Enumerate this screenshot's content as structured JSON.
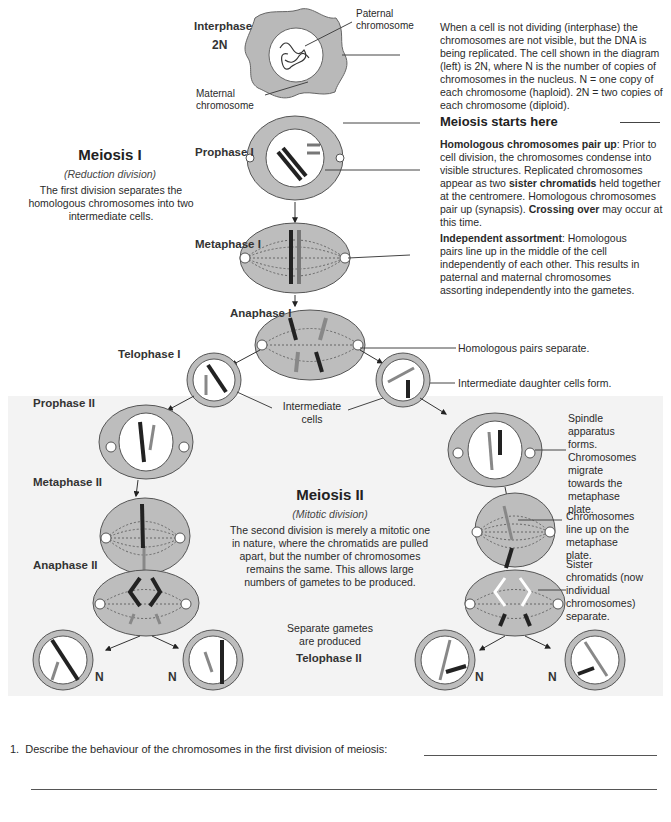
{
  "interphase": {
    "stage": "Interphase",
    "ploidy": "2N",
    "label_paternal": "Paternal\nchromosome",
    "label_maternal": "Maternal\nchromosome",
    "description": "When a cell is not dividing (interphase) the chromosomes are not visible, but the DNA is being replicated. The cell shown in the diagram (left) is 2N, where N is the number of copies of chromosomes in the nucleus. N = one copy of each chromosome (haploid). 2N = two copies of each chromosome (diploid)."
  },
  "meiosis_start": "Meiosis starts here",
  "meiosis1": {
    "title": "Meiosis I",
    "subtitle": "(Reduction division)",
    "description": "The first division separates the homologous chromosomes into two intermediate cells."
  },
  "stages": {
    "prophase1": "Prophase I",
    "metaphase1": "Metaphase I",
    "anaphase1": "Anaphase I",
    "telophase1": "Telophase I",
    "prophase2": "Prophase II",
    "metaphase2": "Metaphase II",
    "anaphase2": "Anaphase II",
    "telophase2": "Telophase II"
  },
  "notes": {
    "prophase1_bold": "Homologous chromosomes pair up",
    "prophase1_a": ": Prior to cell division, the chromosomes condense into visible structures. Replicated chromosomes appear as two ",
    "prophase1_bold2": "sister chromatids",
    "prophase1_b": " held together at the centromere. Homologous chromosomes pair up (synapsis). ",
    "prophase1_bold3": "Crossing over",
    "prophase1_c": " may occur at this time.",
    "metaphase1_bold": "Independent assortment",
    "metaphase1_text": ": Homologous pairs line up in the middle of the cell independently of each other. This results in paternal and maternal chromosomes assorting independently into the gametes.",
    "anaphase1": "Homologous pairs separate.",
    "telophase1": "Intermediate daughter cells form.",
    "intermediate_cells": "Intermediate\ncells",
    "prophase2": "Spindle apparatus forms. Chromosomes migrate towards the metaphase plate.",
    "metaphase2": "Chromosomes line up on the metaphase plate.",
    "anaphase2": "Sister chromatids (now individual chromosomes) separate.",
    "gametes": "Separate gametes are produced"
  },
  "meiosis2": {
    "title": "Meiosis II",
    "subtitle": "(Mitotic division)",
    "description": "The second division is merely a mitotic one in nature, where the chromatids are pulled apart, but the number of chromosomes remains the same. This allows large numbers of gametes to be produced."
  },
  "gamete_label": "N",
  "question": {
    "number": "1.",
    "text": "Describe the behaviour of the chromosomes in the first division of meiosis:",
    "answer": ""
  },
  "colors": {
    "cell_fill": "#bdbdbd",
    "nucleus": "#ffffff",
    "outline": "#555555",
    "panel_bg": "#f3f3f3"
  }
}
